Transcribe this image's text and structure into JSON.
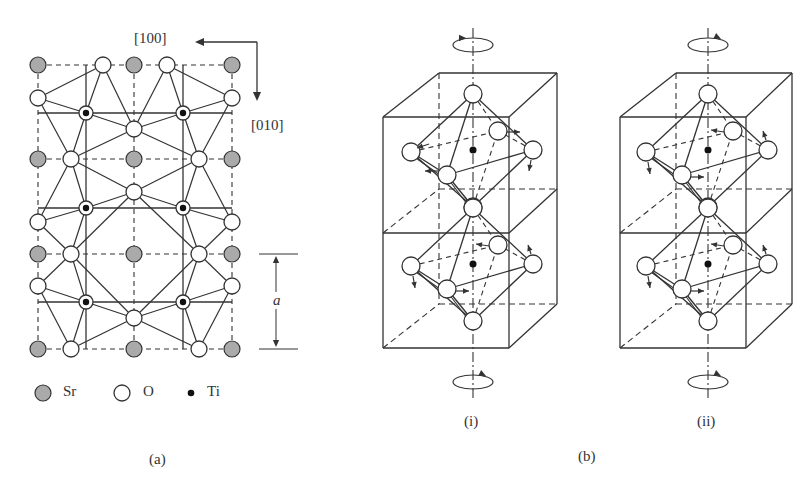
{
  "figure": {
    "panel_a": {
      "caption": "(a)",
      "direction_x_label": "[100]",
      "direction_y_label": "[010]",
      "dimension_label": "a",
      "legend": [
        {
          "symbol": "Sr",
          "label": "Sr",
          "fill": "#aaaaaa"
        },
        {
          "symbol": "O",
          "label": "O",
          "fill": "#ffffff"
        },
        {
          "symbol": "Ti",
          "label": "Ti",
          "fill": "#111111"
        }
      ]
    },
    "panel_b": {
      "caption": "(b)",
      "sub_panels": [
        {
          "caption": "(i)",
          "rotation_top": "counterclockwise",
          "rotation_bottom": "clockwise"
        },
        {
          "caption": "(ii)",
          "rotation_top": "clockwise",
          "rotation_bottom": "clockwise"
        }
      ]
    },
    "colors": {
      "line": "#333333",
      "sr_fill": "#aaaaaa",
      "o_fill": "#ffffff",
      "ti_fill": "#111111",
      "background": "#ffffff"
    }
  }
}
